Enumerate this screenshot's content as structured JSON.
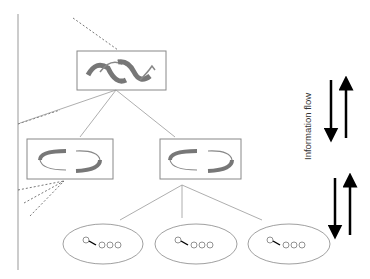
{
  "diagram": {
    "flow_label": "Information flow",
    "levels": [
      {
        "name": "top-level",
        "nodes": 1,
        "icon": "double-cycle-arrows-icon"
      },
      {
        "name": "mid-level",
        "nodes": 2,
        "icon": "cycle-arrows-icon"
      },
      {
        "name": "bottom-level",
        "nodes": 3,
        "icon": "chain-of-circles-icon"
      }
    ],
    "arrows": [
      {
        "direction": "down",
        "group": "upper"
      },
      {
        "direction": "up",
        "group": "upper"
      },
      {
        "direction": "down",
        "group": "lower"
      },
      {
        "direction": "up",
        "group": "lower"
      }
    ],
    "colors": {
      "line": "#777777",
      "box": "#888888",
      "arrow_fill": "#999999",
      "flow_arrow": "#000000"
    }
  }
}
